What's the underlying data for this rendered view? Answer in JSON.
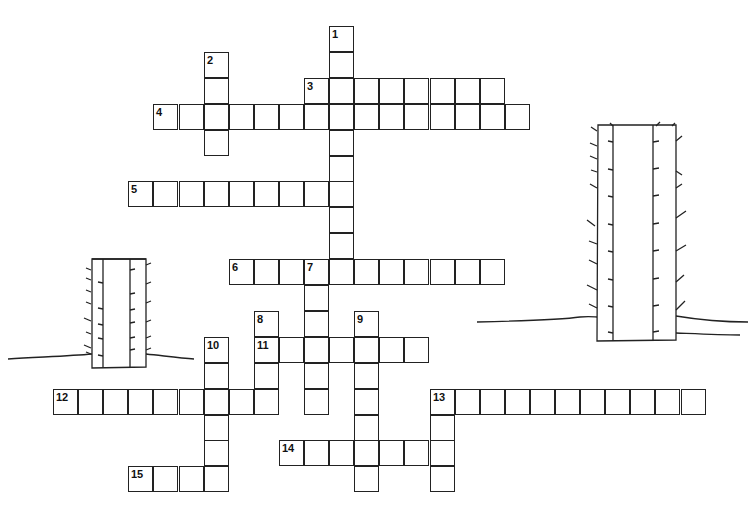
{
  "puzzle": {
    "type": "crossword",
    "grid_origin": {
      "x": 53,
      "y": 26
    },
    "cell_size": {
      "w": 25.1,
      "h": 25.9
    },
    "words": [
      {
        "number": "1",
        "col": 11,
        "row": 0,
        "direction": "down",
        "length": 10
      },
      {
        "number": "2",
        "col": 6,
        "row": 1,
        "direction": "down",
        "length": 4
      },
      {
        "number": "3",
        "col": 10,
        "row": 2,
        "direction": "across",
        "length": 8
      },
      {
        "number": "4",
        "col": 4,
        "row": 3,
        "direction": "across",
        "length": 15
      },
      {
        "number": "5",
        "col": 3,
        "row": 6,
        "direction": "across",
        "length": 9
      },
      {
        "number": "6",
        "col": 7,
        "row": 9,
        "direction": "across",
        "length": 11
      },
      {
        "number": "7",
        "col": 10,
        "row": 9,
        "direction": "down",
        "length": 6
      },
      {
        "number": "8",
        "col": 8,
        "row": 11,
        "direction": "down",
        "length": 4
      },
      {
        "number": "9",
        "col": 12,
        "row": 11,
        "direction": "down",
        "length": 7
      },
      {
        "number": "10",
        "col": 6,
        "row": 12,
        "direction": "down",
        "length": 6
      },
      {
        "number": "11",
        "col": 8,
        "row": 12,
        "direction": "across",
        "length": 7
      },
      {
        "number": "12",
        "col": 0,
        "row": 14,
        "direction": "across",
        "length": 9
      },
      {
        "number": "13",
        "col": 15,
        "row": 14,
        "direction": "across",
        "length": 11
      },
      {
        "number": "13",
        "col": 15,
        "row": 14,
        "direction": "down",
        "length": 4
      },
      {
        "number": "14",
        "col": 9,
        "row": 16,
        "direction": "across",
        "length": 7
      },
      {
        "number": "15",
        "col": 3,
        "row": 17,
        "direction": "across",
        "length": 4
      }
    ]
  },
  "decorations": {
    "cacti": [
      {
        "name": "left-cactus",
        "x": 92,
        "y": 259,
        "w": 54,
        "h": 110
      },
      {
        "name": "right-cactus",
        "x": 597,
        "y": 125,
        "w": 79,
        "h": 216
      }
    ],
    "line_color": "#222222"
  }
}
